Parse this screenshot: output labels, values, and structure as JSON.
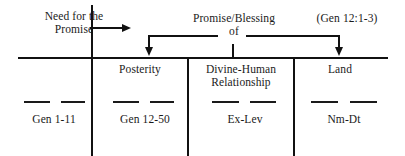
{
  "diagram": {
    "title_hidden": "Pentateuch promise structure chart",
    "top_labels": [
      {
        "id": "need-for-the-promise",
        "text": "Need for the\nPromise"
      },
      {
        "id": "promise-blessing-of",
        "text": "Promise/Blessing\nof"
      },
      {
        "id": "gen-12-1-3-reference",
        "text": "(Gen 12:1-3)"
      }
    ],
    "columns": [
      {
        "id": "col-1",
        "heading": "",
        "code": "Gen 1-11"
      },
      {
        "id": "col-2",
        "heading": "Posterity",
        "code": "Gen 12-50"
      },
      {
        "id": "col-3",
        "heading": "Divine-Human\nRelationship",
        "code": "Ex-Lev"
      },
      {
        "id": "col-4",
        "heading": "Land",
        "code": "Nm-Dt"
      }
    ],
    "arrows": [
      {
        "id": "arrow-need-to-promise",
        "direction": "right"
      },
      {
        "id": "arrow-to-posterity",
        "direction": "down"
      },
      {
        "id": "arrow-to-land",
        "direction": "down"
      }
    ],
    "colors": {
      "ink": "#111111",
      "paper": "#ffffff"
    }
  }
}
